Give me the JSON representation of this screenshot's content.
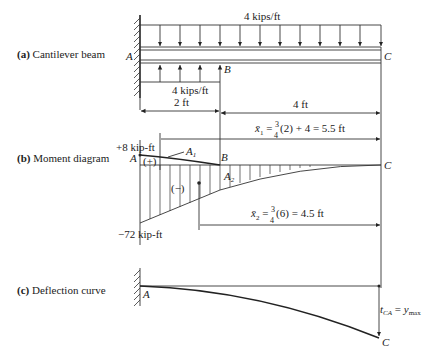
{
  "panels": {
    "a": {
      "tag": "(a)",
      "title": "Cantilever beam"
    },
    "b": {
      "tag": "(b)",
      "title": "Moment diagram"
    },
    "c": {
      "tag": "(c)",
      "title": "Deflection curve"
    }
  },
  "beam": {
    "point_a": "A",
    "point_b": "B",
    "point_c": "C",
    "top_load": "4 kips/ft",
    "bottom_load": "4 kips/ft",
    "dim_ab": "2 ft",
    "dim_bc": "4 ft"
  },
  "moment": {
    "point_a": "A",
    "point_b": "B",
    "point_c": "C",
    "max_pos": "+8 kip-ft",
    "max_neg": "−72 kip-ft",
    "pos_sign": "(+)",
    "neg_sign": "(−)",
    "area1": "A",
    "area1_sub": "1",
    "area2": "A",
    "area2_sub": "2",
    "xbar1_sym": "x̄",
    "xbar1_sub": "1",
    "xbar1_eq_pre": " = ",
    "xbar1_num": "3",
    "xbar1_den": "4",
    "xbar1_eq_post": "(2) + 4 = 5.5 ft",
    "xbar2_sym": "x̄",
    "xbar2_sub": "2",
    "xbar2_eq_pre": " = ",
    "xbar2_num": "3",
    "xbar2_den": "4",
    "xbar2_eq_post": "(6) = 4.5 ft"
  },
  "deflection": {
    "point_a": "A",
    "point_c": "C",
    "t_sym": "t",
    "t_sub": "CA",
    "eq": " = ",
    "y_sym": "y",
    "y_sub": "max"
  }
}
